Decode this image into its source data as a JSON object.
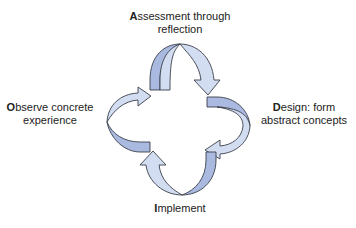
{
  "diagram": {
    "stages": [
      {
        "id": "assessment",
        "position": "top",
        "initial": "A",
        "rest": "ssessment through",
        "line2": "reflection"
      },
      {
        "id": "design",
        "position": "right",
        "initial": "D",
        "rest": "esign: form",
        "line2": "abstract concepts"
      },
      {
        "id": "implement",
        "position": "bottom",
        "initial": "I",
        "rest": "mplement",
        "line2": ""
      },
      {
        "id": "observe",
        "position": "left",
        "initial": "O",
        "rest": "bserve concrete",
        "line2": "experience"
      }
    ],
    "flow": "clockwise",
    "colors": {
      "arrow_light": "#d3ddf1",
      "arrow_dark": "#a9b9e0",
      "outline": "#3a3f4a",
      "text": "#222222"
    }
  }
}
